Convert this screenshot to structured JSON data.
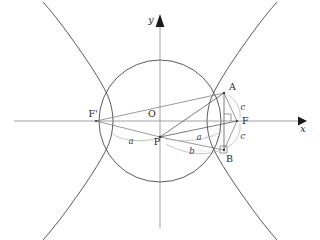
{
  "figure": {
    "type": "geometry-diagram"
  },
  "axes": {
    "x_label": "x",
    "y_label": "y",
    "origin_label": "O"
  },
  "points": [
    {
      "id": "origin",
      "label": "O",
      "x": 160,
      "y": 121
    },
    {
      "id": "focus-left",
      "label": "F'",
      "x": 96,
      "y": 121
    },
    {
      "id": "focus-right",
      "label": "F",
      "x": 237,
      "y": 121
    },
    {
      "id": "point-p",
      "label": "P",
      "x": 160,
      "y": 137
    },
    {
      "id": "point-a",
      "label": "A",
      "x": 224,
      "y": 93
    },
    {
      "id": "point-b",
      "label": "B",
      "x": 224,
      "y": 150
    }
  ],
  "segment_labels": [
    {
      "id": "seg-a-left",
      "label": "a",
      "x": 131,
      "y": 141
    },
    {
      "id": "seg-a-right",
      "label": "a",
      "x": 199,
      "y": 138
    },
    {
      "id": "seg-b",
      "label": "b",
      "x": 192,
      "y": 151
    },
    {
      "id": "seg-c-upper",
      "label": "c",
      "x": 243,
      "y": 108
    },
    {
      "id": "seg-c-lower",
      "label": "c",
      "x": 243,
      "y": 135
    }
  ],
  "colors": {
    "curve": "#4a4a4a",
    "axis": "#8c8c8c",
    "ray": "#6e6e6e",
    "leader": "#a9a9a9",
    "text": "#262626",
    "background": "#ffffff"
  },
  "geometry": {
    "circle": {
      "cx": 160,
      "cy": 121,
      "r": 61
    },
    "hyperbola": {
      "center_x": 160,
      "center_y": 121,
      "a": 47,
      "b": 49
    },
    "axis_y_top": 16,
    "axis_x_right": 303
  }
}
